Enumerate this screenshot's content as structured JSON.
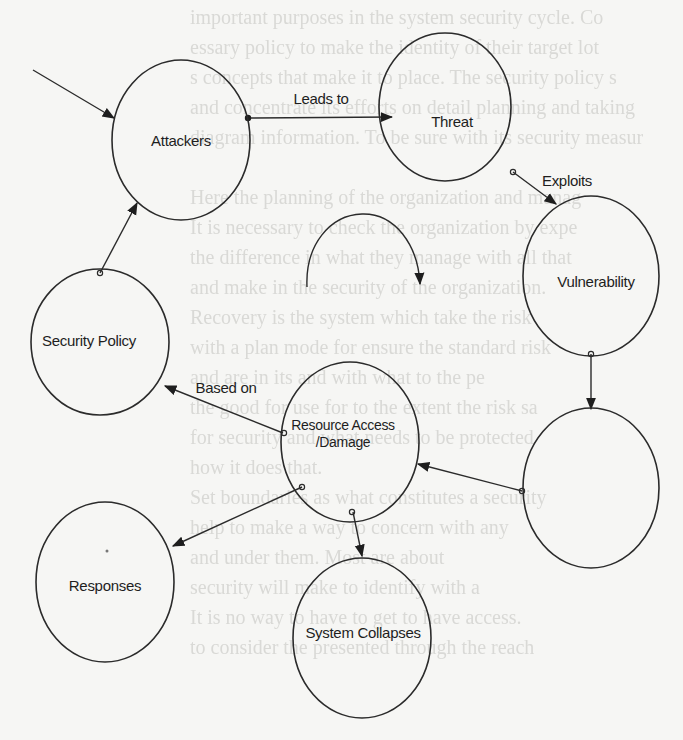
{
  "figure": {
    "type": "cycle diagram",
    "background_color": "#f6f6f4",
    "line_color": "#2b2b2b"
  },
  "nodes": [
    {
      "id": "attackers",
      "label": "Attackers",
      "cx": 181,
      "cy": 140,
      "rx": 69,
      "ry": 80
    },
    {
      "id": "threat",
      "label": "Threat",
      "cx": 445,
      "cy": 107,
      "rx": 66,
      "ry": 74
    },
    {
      "id": "vulnerability",
      "label": "Vulnerability",
      "cx": 591,
      "cy": 276,
      "rx": 68,
      "ry": 80
    },
    {
      "id": "security-policy",
      "label": "Security Policy",
      "cx": 100,
      "cy": 342,
      "rx": 69,
      "ry": 73
    },
    {
      "id": "resource-access",
      "label_lines": [
        "Resource Access",
        "/Damage"
      ],
      "cx": 350,
      "cy": 442,
      "rx": 69,
      "ry": 80
    },
    {
      "id": "unlabeled",
      "label": "",
      "cx": 591,
      "cy": 488,
      "rx": 68,
      "ry": 80
    },
    {
      "id": "responses",
      "label": "Responses",
      "cx": 105,
      "cy": 582,
      "rx": 69,
      "ry": 80
    },
    {
      "id": "system-collapses",
      "label": "System Collapses",
      "cx": 362,
      "cy": 638,
      "rx": 69,
      "ry": 80
    }
  ],
  "edges": [
    {
      "from": "external",
      "to": "attackers",
      "label": ""
    },
    {
      "from": "attackers",
      "to": "threat",
      "label": "Leads to"
    },
    {
      "from": "threat",
      "to": "vulnerability",
      "label": "Exploits"
    },
    {
      "from": "vulnerability",
      "to": "unlabeled",
      "label": ""
    },
    {
      "from": "unlabeled",
      "to": "resource-access",
      "label": ""
    },
    {
      "from": "resource-access",
      "to": "security-policy",
      "label": "Based on"
    },
    {
      "from": "security-policy",
      "to": "attackers",
      "label": ""
    },
    {
      "from": "resource-access",
      "to": "responses",
      "label": ""
    },
    {
      "from": "resource-access",
      "to": "system-collapses",
      "label": ""
    }
  ],
  "labels": {
    "attackers": "Attackers",
    "threat": "Threat",
    "vulnerability": "Vulnerability",
    "security_policy": "Security Policy",
    "resource_access_line1": "Resource Access",
    "resource_access_line2": "/Damage",
    "responses": "Responses",
    "system_collapses": "System Collapses",
    "leads_to": "Leads to",
    "exploits": "Exploits",
    "based_on": "Based on"
  },
  "decorations": {
    "cycle_arrow": "partial curved arrow indicating cyclic flow (center of diagram)"
  },
  "bleed_through_text": [
    "important purposes in the system security cycle. Co",
    "essary policy to make the identity of their target lot",
    "s concepts that make it to place. The security policy s",
    "and concentrate its efforts on detail planning and taking",
    "diagram information. To be sure with its security measur",
    "",
    "Here the planning of the organization and manag",
    "It is necessary to check the organization by expe",
    "the difference in what they manage with all that",
    "and make in the security of the organization.",
    "Recovery is the system which take the risk",
    "with a plan mode for ensure the standard risk",
    "and are in its and with what to the pe",
    "the good for use for to the extent the risk sa",
    "for security and what needs to be protected",
    "how it does that.",
    "Set boundaries as what constitutes a security",
    "help to make a way to concern with any",
    "and under them. Most are about",
    "security will make to identify with a",
    "It is no way to have to get to have access.",
    "to consider the presented through the reach"
  ]
}
